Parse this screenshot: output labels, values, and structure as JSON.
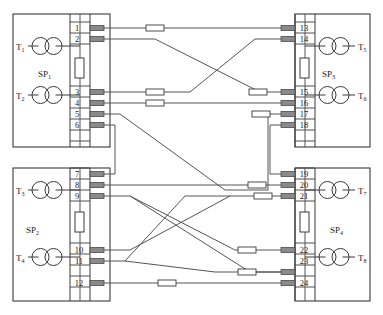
{
  "diagram": {
    "type": "electrical-wiring-schematic",
    "colors": {
      "background": "#ffffff",
      "line": "#3a3a3a",
      "wire": "#555555",
      "terminal_block_fill": "#8a8a8a",
      "resistor_fill": "#ffffff",
      "text": "#1a1a1a"
    },
    "cabinets": [
      {
        "id": "sp1",
        "label": "SP",
        "sub": "1",
        "position": "top-left",
        "transformers": [
          {
            "label": "T",
            "sub": "1"
          },
          {
            "label": "T",
            "sub": "2"
          }
        ],
        "terminals": [
          "1",
          "2",
          "3",
          "4",
          "5",
          "6"
        ]
      },
      {
        "id": "sp2",
        "label": "SP",
        "sub": "2",
        "position": "bottom-left",
        "transformers": [
          {
            "label": "T",
            "sub": "3"
          },
          {
            "label": "T",
            "sub": "4"
          }
        ],
        "terminals": [
          "7",
          "8",
          "9",
          "10",
          "11",
          "12"
        ]
      },
      {
        "id": "sp3",
        "label": "SP",
        "sub": "3",
        "position": "top-right",
        "transformers": [
          {
            "label": "T",
            "sub": "5"
          },
          {
            "label": "T",
            "sub": "6"
          }
        ],
        "terminals": [
          "13",
          "14",
          "15",
          "16",
          "17",
          "18"
        ]
      },
      {
        "id": "sp4",
        "label": "SP",
        "sub": "4",
        "position": "bottom-right",
        "transformers": [
          {
            "label": "T",
            "sub": "7"
          },
          {
            "label": "T",
            "sub": "8"
          }
        ],
        "terminals": [
          "19",
          "20",
          "21",
          "22",
          "23",
          "24"
        ]
      }
    ],
    "connections": [
      {
        "from": "1",
        "to": "13",
        "routing": "straight",
        "inline_resistors": 1
      },
      {
        "from": "2",
        "to": "15",
        "routing": "diagonal-down",
        "inline_resistors": 1
      },
      {
        "from": "3",
        "to": "14",
        "routing": "diagonal-up",
        "inline_resistors": 1
      },
      {
        "from": "4",
        "to": "16",
        "routing": "straight",
        "inline_resistors": 1
      },
      {
        "from": "5",
        "to": "17",
        "routing": "diagonal-down-up",
        "inline_resistors": 1
      },
      {
        "from": "6",
        "to": "7",
        "routing": "loop-resistor",
        "inline_resistors": 1
      },
      {
        "from": "8",
        "to": "20",
        "routing": "straight",
        "inline_resistors": 1
      },
      {
        "from": "9",
        "to": "22",
        "routing": "diagonal-down",
        "inline_resistors": 1
      },
      {
        "from": "10",
        "to": "21",
        "routing": "diagonal-up",
        "inline_resistors": 1
      },
      {
        "from": "11",
        "to": "23",
        "routing": "diagonal-down",
        "inline_resistors": 1
      },
      {
        "from": "12",
        "to": "24",
        "routing": "straight",
        "inline_resistors": 1
      },
      {
        "from": "18",
        "to": "19",
        "routing": "loop-resistor",
        "inline_resistors": 1
      }
    ]
  }
}
